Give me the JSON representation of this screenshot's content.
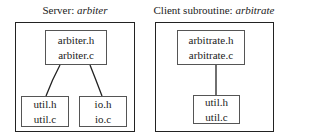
{
  "server": {
    "title_prefix": "Server: ",
    "title_name": "arbiter",
    "modules": [
      {
        "id": "arbiter",
        "files": [
          "arbiter.h",
          "arbiter.c"
        ]
      },
      {
        "id": "util",
        "files": [
          "util.h",
          "util.c"
        ]
      },
      {
        "id": "io",
        "files": [
          "io.h",
          "io.c"
        ]
      }
    ]
  },
  "client": {
    "title_prefix": "Client subroutine: ",
    "title_name": "arbitrate",
    "modules": [
      {
        "id": "arbitrate",
        "files": [
          "arbitrate.h",
          "arbitrate.c"
        ]
      },
      {
        "id": "util",
        "files": [
          "util.h",
          "util.c"
        ]
      }
    ]
  }
}
